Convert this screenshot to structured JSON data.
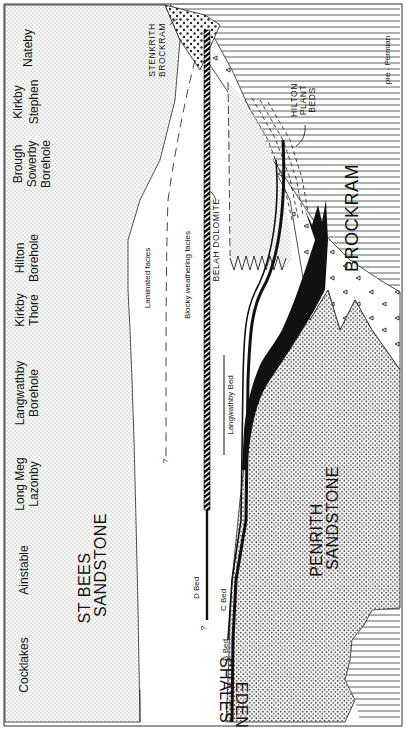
{
  "diagram": {
    "type": "geological cross-section",
    "orientation": "rotated 90 degrees clockwise",
    "localities": [
      {
        "id": "nateby",
        "lines": [
          "Nateby"
        ]
      },
      {
        "id": "kirkby-stephen",
        "lines": [
          "Kirkby",
          "Stephen"
        ]
      },
      {
        "id": "brough-sowerby",
        "lines": [
          "Brough",
          "Sowerby",
          "Borehole"
        ]
      },
      {
        "id": "hilton",
        "lines": [
          "Hilton",
          "Borehole"
        ]
      },
      {
        "id": "kirkby-thore",
        "lines": [
          "Kirkby",
          "Thore"
        ]
      },
      {
        "id": "langwathby",
        "lines": [
          "Langwathby",
          "Borehole"
        ]
      },
      {
        "id": "long-meg",
        "lines": [
          "Long Meg",
          "Lazonby"
        ]
      },
      {
        "id": "ainstable",
        "lines": [
          "Ainstable"
        ]
      },
      {
        "id": "cocklakes",
        "lines": [
          "Cocklakes"
        ]
      }
    ],
    "units": {
      "st_bees": [
        "ST  BEES",
        "SANDSTONE"
      ],
      "penrith": [
        "PENRITH",
        "SANDSTONE"
      ],
      "brockram": "BROCKRAM",
      "eden_shales": [
        "EDEN",
        "SHALES"
      ],
      "stenkrith": [
        "STENKRITH",
        "BROCKRAM"
      ],
      "belah_dolomite": "BELAH DOLOMITE",
      "hilton_plant_beds": [
        "HILTON",
        "PLANT",
        "BEDS"
      ],
      "pre_permian": "pre - Permian"
    },
    "facies": {
      "laminated": "Laminated facies",
      "blocky": "Blocky weathering facies",
      "query": "?"
    },
    "beds": {
      "a": "A Bed",
      "b": "B Bed",
      "c": "C Bed",
      "d": "D Bed",
      "langwathby": "Langwathby Bed",
      "query": "?"
    },
    "colors": {
      "ink": "#111111",
      "paper": "#ffffff",
      "stipple_light": "#bdbdbd",
      "stipple_dark": "#555555"
    }
  }
}
